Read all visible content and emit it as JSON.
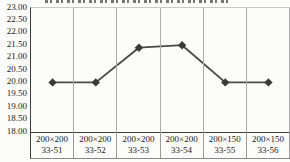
{
  "chart_data": {
    "type": "line",
    "title": "",
    "legend": "none",
    "grid": "vertical-only",
    "marker": "diamond",
    "categories": [
      {
        "size": "200×200",
        "id": "33-51"
      },
      {
        "size": "200×200",
        "id": "33-52"
      },
      {
        "size": "200×200",
        "id": "33-53"
      },
      {
        "size": "200×200",
        "id": "33-54"
      },
      {
        "size": "200×150",
        "id": "33-55"
      },
      {
        "size": "200×150",
        "id": "33-56"
      }
    ],
    "values": [
      20.0,
      20.0,
      21.4,
      21.5,
      20.0,
      20.0
    ],
    "ylim": [
      18.0,
      23.0
    ],
    "ytick_step": 0.5,
    "ytick_labels": [
      "23.00",
      "22.50",
      "22.00",
      "21.50",
      "21.00",
      "20.50",
      "20.00",
      "19.50",
      "19.00",
      "18.50",
      "18.00"
    ],
    "colors": {
      "line": "#4a4a4a",
      "marker": "#3a3a3a",
      "gridline": "#acacac",
      "axis": "#3d3d3d",
      "text": "#1a1a1a",
      "background": "#fcfcfa"
    }
  }
}
